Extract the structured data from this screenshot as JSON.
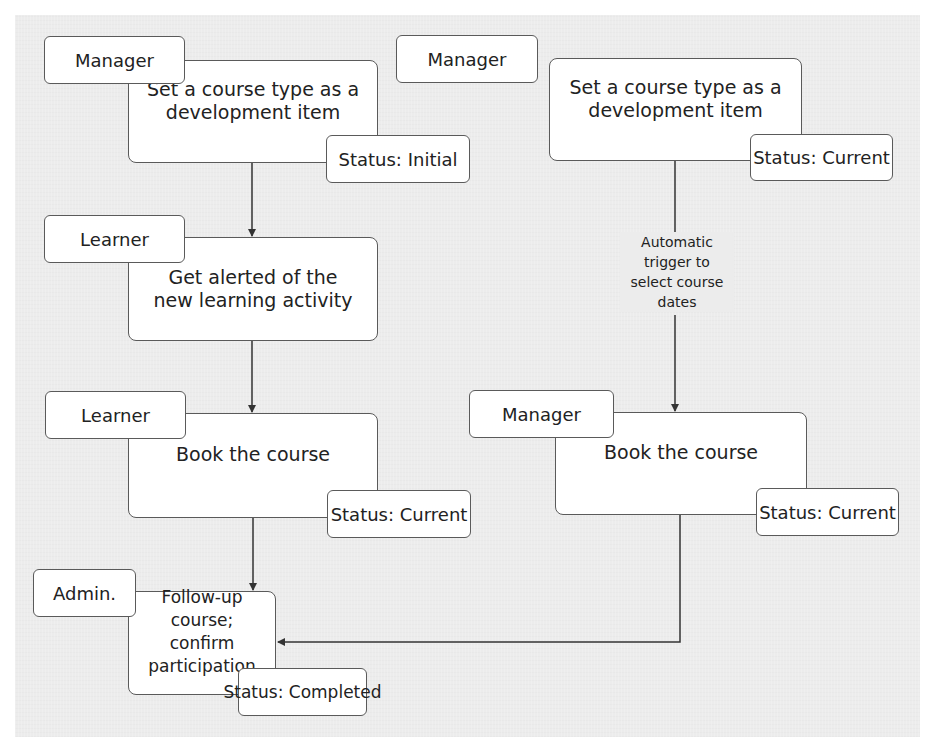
{
  "diagram": {
    "type": "process-flow",
    "left_flow": {
      "steps": [
        {
          "role": "Manager",
          "activity": "Set a course type as a\ndevelopment item",
          "status": "Status: Initial"
        },
        {
          "role": "Learner",
          "activity": "Get alerted of the\nnew learning activity",
          "status": null
        },
        {
          "role": "Learner",
          "activity": "Book the course",
          "status": "Status: Current"
        },
        {
          "role": "Admin.",
          "activity": "Follow-up course;\nconfirm participation",
          "status": "Status: Completed"
        }
      ]
    },
    "right_flow": {
      "steps": [
        {
          "role": "Manager",
          "activity": "Set a course type as a\ndevelopment item",
          "status": "Status: Current"
        },
        {
          "role": "Manager",
          "activity": "Book the course",
          "status": "Status: Current"
        }
      ],
      "connector_label": "Automatic\ntrigger to\nselect course\ndates",
      "merges_into": "Follow-up course; confirm participation"
    },
    "colors": {
      "background_panel": "#ececec",
      "box_fill": "#ffffff",
      "box_border": "#5a5a5a",
      "line": "#333333",
      "text": "#222222"
    }
  }
}
